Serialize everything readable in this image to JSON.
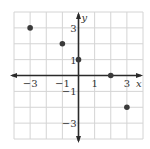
{
  "chart_data": {
    "type": "scatter",
    "title": "",
    "xlabel": "x",
    "ylabel": "y",
    "xlim": [
      -4,
      4
    ],
    "ylim": [
      -4,
      4
    ],
    "grid": true,
    "x_tick_labels": [
      {
        "value": -3,
        "label": "−3"
      },
      {
        "value": -1,
        "label": "−1"
      },
      {
        "value": 1,
        "label": "1"
      },
      {
        "value": 3,
        "label": "3"
      }
    ],
    "y_tick_labels": [
      {
        "value": 3,
        "label": "3"
      },
      {
        "value": 1,
        "label": "1"
      },
      {
        "value": -1,
        "label": "−1"
      },
      {
        "value": -3,
        "label": "−3"
      }
    ],
    "series": [
      {
        "name": "points",
        "points": [
          {
            "x": -3,
            "y": 3
          },
          {
            "x": -1,
            "y": 2
          },
          {
            "x": 0,
            "y": 1
          },
          {
            "x": 2,
            "y": 0
          },
          {
            "x": 3,
            "y": -2
          }
        ]
      }
    ],
    "colors": {
      "grid": "#d4d4d4",
      "axis": "#2a2a2a",
      "point": "#3a3a3a",
      "text": "#333333"
    }
  }
}
